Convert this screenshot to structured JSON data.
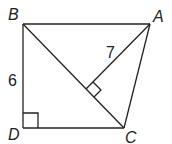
{
  "diagram": {
    "type": "geometry",
    "points": {
      "A": {
        "label": "A",
        "x": 150,
        "y": 24
      },
      "B": {
        "label": "B",
        "x": 23,
        "y": 24
      },
      "C": {
        "label": "C",
        "x": 124,
        "y": 128
      },
      "D": {
        "label": "D",
        "x": 23,
        "y": 128
      }
    },
    "segments": [
      "BA",
      "BD",
      "DC",
      "AC",
      "BC",
      "AF"
    ],
    "foot": {
      "label": "",
      "x": 86,
      "y": 89
    },
    "measures": {
      "BD": "6",
      "AF": "7"
    },
    "right_angles": [
      "D",
      "F on BC"
    ]
  }
}
